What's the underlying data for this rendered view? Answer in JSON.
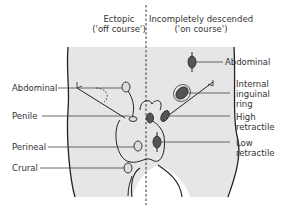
{
  "headers": {
    "ectopic": {
      "line1": "Ectopic",
      "line2": "('off course')"
    },
    "incomplete": {
      "line1": "Incompletely descended",
      "line2": "('on course')"
    }
  },
  "left_labels": {
    "abdominal": "Abdominal",
    "penile": "Penile",
    "perineal": "Perineal",
    "crural": "Crural"
  },
  "right_labels": {
    "abdominal": "Abdominal",
    "internal_inguinal_ring": [
      "Internal",
      "inguinal",
      "ring"
    ],
    "high_retractile": [
      "High",
      "retractile"
    ],
    "low_retractile": [
      "Low",
      "retractile"
    ]
  },
  "colors": {
    "body_fill": "#e6e6e6",
    "outline": "#222222",
    "testis_dark": "#555555",
    "testis_light": "#dcdcdc",
    "leader_line": "#444444"
  }
}
